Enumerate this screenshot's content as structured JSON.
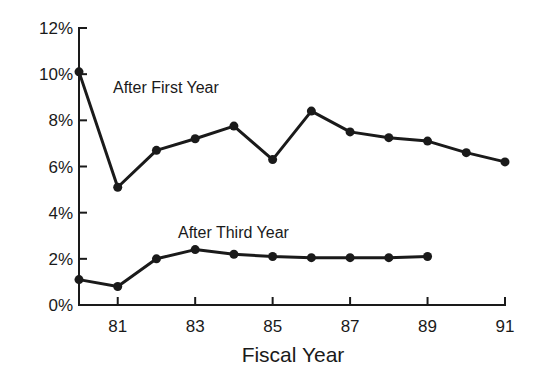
{
  "chart_data": {
    "type": "line",
    "title": "",
    "xlabel": "Fiscal Year",
    "ylabel": "",
    "x": [
      80,
      81,
      82,
      83,
      84,
      85,
      86,
      87,
      88,
      89,
      90,
      91
    ],
    "xticks": [
      "81",
      "83",
      "85",
      "87",
      "89",
      "91"
    ],
    "yticks": [
      "0%",
      "2%",
      "4%",
      "6%",
      "8%",
      "10%",
      "12%"
    ],
    "ylim": [
      0,
      12
    ],
    "xlim": [
      80,
      91
    ],
    "grid": false,
    "legend": "inline annotations",
    "series": [
      {
        "name": "After First Year",
        "x": [
          80,
          81,
          82,
          83,
          84,
          85,
          86,
          87,
          88,
          89,
          90,
          91
        ],
        "values": [
          10.1,
          5.1,
          6.7,
          7.2,
          7.75,
          6.3,
          8.4,
          7.5,
          7.25,
          7.1,
          6.6,
          6.2
        ]
      },
      {
        "name": "After Third Year",
        "x": [
          80,
          81,
          82,
          83,
          84,
          85,
          86,
          87,
          88,
          89
        ],
        "values": [
          1.1,
          0.8,
          2.0,
          2.4,
          2.2,
          2.1,
          2.05,
          2.05,
          2.05,
          2.1
        ]
      }
    ],
    "annotations": [
      {
        "text": "After First Year",
        "series": 0
      },
      {
        "text": "After Third Year",
        "series": 1
      }
    ]
  },
  "colors": {
    "line": "#1a1a1a",
    "background": "#ffffff"
  }
}
